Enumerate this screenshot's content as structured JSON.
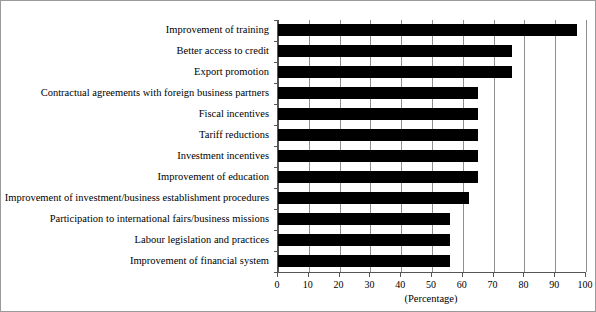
{
  "chart_data": {
    "type": "bar",
    "orientation": "horizontal",
    "title": "",
    "subtitle": "",
    "xlabel": "(Percentage)",
    "ylabel": "",
    "xlim": [
      0,
      100
    ],
    "ylim": null,
    "grid": true,
    "legend": null,
    "bar_color": "#000000",
    "categories": [
      "Improvement of training",
      "Better access to credit",
      "Export promotion",
      "Contractual agreements with foreign business partners",
      "Fiscal incentives",
      "Tariff reductions",
      "Investment incentives",
      "Improvement of education",
      "Improvement of investment/business establishment procedures",
      "Participation to international fairs/business missions",
      "Labour legislation and practices",
      "Improvement of financial system"
    ],
    "values": [
      97,
      76,
      76,
      65,
      65,
      65,
      65,
      65,
      62,
      56,
      56,
      56
    ],
    "xticks": [
      0,
      10,
      20,
      30,
      40,
      50,
      60,
      70,
      80,
      90,
      100
    ],
    "xtick_labels": [
      "0",
      "10",
      "20",
      "30",
      "40",
      "50",
      "60",
      "70",
      "80",
      "90",
      "100"
    ]
  }
}
